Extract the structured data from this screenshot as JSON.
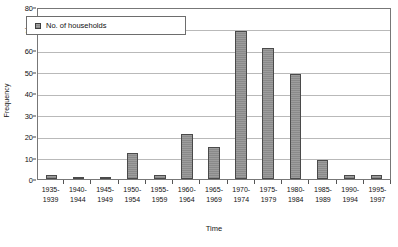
{
  "chart_data": {
    "type": "bar",
    "title": "",
    "xlabel": "Time",
    "ylabel": "Frequency",
    "ylim": [
      0,
      80
    ],
    "ystep": 10,
    "grid": true,
    "legend_position": "top-left-inside",
    "legend": [
      "No. of households"
    ],
    "categories": [
      "1935-1939",
      "1940-1944",
      "1945-1949",
      "1950-1954",
      "1955-1959",
      "1960-1964",
      "1965-1969",
      "1970-1974",
      "1975-1979",
      "1980-1984",
      "1985-1989",
      "1990-1994",
      "1995-1997"
    ],
    "category_lines": [
      [
        "1935-",
        "1939"
      ],
      [
        "1940-",
        "1944"
      ],
      [
        "1945-",
        "1949"
      ],
      [
        "1950-",
        "1954"
      ],
      [
        "1955-",
        "1959"
      ],
      [
        "1960-",
        "1964"
      ],
      [
        "1965-",
        "1969"
      ],
      [
        "1970-",
        "1974"
      ],
      [
        "1975-",
        "1979"
      ],
      [
        "1980-",
        "1984"
      ],
      [
        "1985-",
        "1989"
      ],
      [
        "1990-",
        "1994"
      ],
      [
        "1995-",
        "1997"
      ]
    ],
    "values": [
      2,
      1,
      1,
      12,
      2,
      21,
      15,
      69,
      61,
      49,
      9,
      2,
      2
    ],
    "series": [
      {
        "name": "No. of households",
        "values": [
          2,
          1,
          1,
          12,
          2,
          21,
          15,
          69,
          61,
          49,
          9,
          2,
          2
        ]
      }
    ],
    "yticks": [
      0,
      10,
      20,
      30,
      40,
      50,
      60,
      70,
      80
    ],
    "ytick_labels": [
      "0",
      "10",
      "20",
      "30",
      "40",
      "50",
      "60",
      "70",
      "80"
    ],
    "colors": {
      "bar_fill": "#8a8a8a",
      "bar_border": "#4a4a4a",
      "gridline": "#b9b9b9",
      "frame": "#777777",
      "text": "#111111",
      "background": "#ffffff"
    }
  }
}
